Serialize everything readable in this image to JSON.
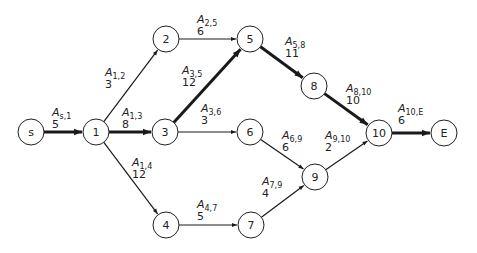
{
  "diagram": {
    "title": "",
    "type": "activity-network",
    "node_radius": 13,
    "nodes": [
      {
        "id": "s",
        "label": "s",
        "x": 31,
        "y": 132
      },
      {
        "id": "1",
        "label": "1",
        "x": 96,
        "y": 132
      },
      {
        "id": "2",
        "label": "2",
        "x": 166,
        "y": 39
      },
      {
        "id": "3",
        "label": "3",
        "x": 165,
        "y": 132
      },
      {
        "id": "4",
        "label": "4",
        "x": 166,
        "y": 225
      },
      {
        "id": "5",
        "label": "5",
        "x": 250,
        "y": 39
      },
      {
        "id": "6",
        "label": "6",
        "x": 250,
        "y": 132
      },
      {
        "id": "7",
        "label": "7",
        "x": 251,
        "y": 225
      },
      {
        "id": "8",
        "label": "8",
        "x": 314,
        "y": 86
      },
      {
        "id": "9",
        "label": "9",
        "x": 315,
        "y": 177
      },
      {
        "id": "10",
        "label": "10",
        "x": 379,
        "y": 133
      },
      {
        "id": "E",
        "label": "E",
        "x": 444,
        "y": 133
      }
    ],
    "edges": [
      {
        "from": "s",
        "to": "1",
        "name": "A",
        "sub": "s,1",
        "weight": "5",
        "critical": true,
        "lx": 52,
        "ly": 116
      },
      {
        "from": "1",
        "to": "2",
        "name": "A",
        "sub": "1,2",
        "weight": "3",
        "critical": false,
        "lx": 105,
        "ly": 76
      },
      {
        "from": "1",
        "to": "3",
        "name": "A",
        "sub": "1,3",
        "weight": "8",
        "critical": true,
        "lx": 122,
        "ly": 116
      },
      {
        "from": "1",
        "to": "4",
        "name": "A",
        "sub": "1,4",
        "weight": "12",
        "critical": false,
        "lx": 132,
        "ly": 166
      },
      {
        "from": "2",
        "to": "5",
        "name": "A",
        "sub": "2,5",
        "weight": "6",
        "critical": false,
        "lx": 197,
        "ly": 23
      },
      {
        "from": "3",
        "to": "5",
        "name": "A",
        "sub": "3,5",
        "weight": "12",
        "critical": true,
        "lx": 182,
        "ly": 74
      },
      {
        "from": "3",
        "to": "6",
        "name": "A",
        "sub": "3,6",
        "weight": "3",
        "critical": false,
        "lx": 201,
        "ly": 112
      },
      {
        "from": "4",
        "to": "7",
        "name": "A",
        "sub": "4,7",
        "weight": "5",
        "critical": false,
        "lx": 197,
        "ly": 208
      },
      {
        "from": "5",
        "to": "8",
        "name": "A",
        "sub": "5,8",
        "weight": "11",
        "critical": true,
        "lx": 285,
        "ly": 45
      },
      {
        "from": "6",
        "to": "9",
        "name": "A",
        "sub": "6,9",
        "weight": "6",
        "critical": false,
        "lx": 282,
        "ly": 139
      },
      {
        "from": "7",
        "to": "9",
        "name": "A",
        "sub": "7,9",
        "weight": "4",
        "critical": false,
        "lx": 262,
        "ly": 185
      },
      {
        "from": "8",
        "to": "10",
        "name": "A",
        "sub": "8,10",
        "weight": "10",
        "critical": true,
        "lx": 346,
        "ly": 92
      },
      {
        "from": "9",
        "to": "10",
        "name": "A",
        "sub": "9,10",
        "weight": "2",
        "critical": false,
        "lx": 325,
        "ly": 139
      },
      {
        "from": "10",
        "to": "E",
        "name": "A",
        "sub": "10,E",
        "weight": "6",
        "critical": true,
        "lx": 398,
        "ly": 112
      }
    ],
    "colors": {
      "stroke": "#1a1a1a",
      "node_fill": "#ffffff",
      "background": "#ffffff"
    }
  }
}
